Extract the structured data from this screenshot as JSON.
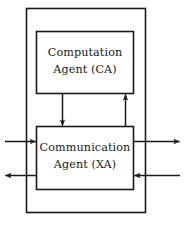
{
  "figure": {
    "type": "block-diagram",
    "title": "",
    "background_color": "#ffffff",
    "stroke_color": "#1a1a1a",
    "text_color": "#1a1a1a"
  },
  "outer_boundary": {
    "name": "agent-system-boundary",
    "label": ""
  },
  "blocks": [
    {
      "id": "computation-agent",
      "line1": "Computation",
      "line2": "Agent (CA)",
      "abbreviation": "CA"
    },
    {
      "id": "communication-agent",
      "line1": "Communication",
      "line2": "Agent (XA)",
      "abbreviation": "XA"
    }
  ],
  "connectors": [
    {
      "id": "ca-to-xa",
      "direction": "down",
      "from": "computation-agent",
      "to": "communication-agent",
      "label": ""
    },
    {
      "id": "xa-to-ca",
      "direction": "up",
      "from": "communication-agent",
      "to": "computation-agent",
      "label": ""
    },
    {
      "id": "external-in-left",
      "direction": "right",
      "from": "external-left",
      "to": "communication-agent",
      "label": ""
    },
    {
      "id": "external-out-left",
      "direction": "left",
      "from": "communication-agent",
      "to": "external-left",
      "label": ""
    },
    {
      "id": "external-out-right",
      "direction": "right",
      "from": "communication-agent",
      "to": "external-right",
      "label": ""
    },
    {
      "id": "external-in-right",
      "direction": "left",
      "from": "external-right",
      "to": "communication-agent",
      "label": ""
    }
  ]
}
